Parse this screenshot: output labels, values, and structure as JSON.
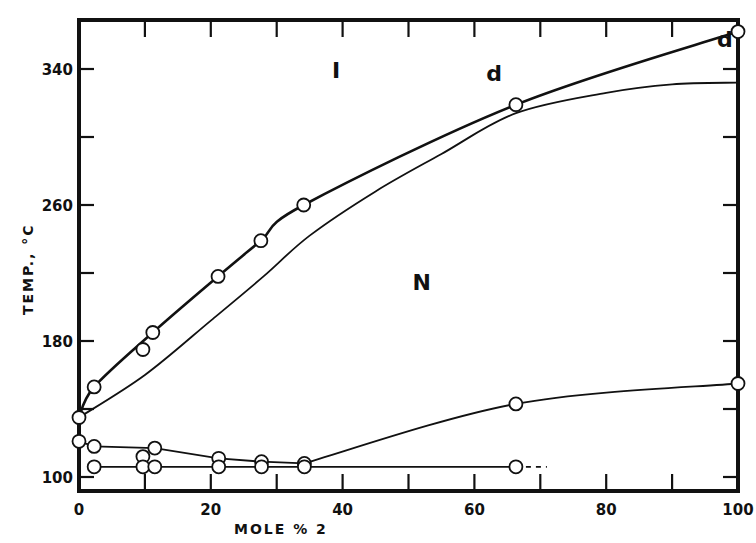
{
  "chart_data": {
    "type": "line",
    "title": "",
    "xlabel": "MOLE % 2",
    "ylabel": "TEMP., °C",
    "xlim": [
      0,
      100
    ],
    "ylim": [
      92,
      369
    ],
    "grid": false,
    "x_ticks": [
      0,
      20,
      40,
      60,
      80,
      100
    ],
    "x_minor_ticks": [
      10,
      30,
      50,
      70,
      90
    ],
    "y_ticks": [
      100,
      180,
      260,
      340
    ],
    "y_minor_ticks": [
      140,
      220,
      300
    ],
    "regions": [
      {
        "label": "I",
        "x": 39,
        "y": 335
      },
      {
        "label": "N",
        "x": 52,
        "y": 210
      }
    ],
    "annotations": [
      {
        "label": "d",
        "x": 63,
        "y": 333
      },
      {
        "label": "d",
        "x": 98,
        "y": 353
      }
    ],
    "series": [
      {
        "name": "clearing (N-I) upper curve",
        "style": "thick",
        "markers": true,
        "points": [
          [
            0,
            135
          ],
          [
            2.3,
            153
          ],
          [
            11.2,
            185
          ],
          [
            21.1,
            218
          ],
          [
            27.6,
            239
          ],
          [
            34.1,
            260
          ],
          [
            66.3,
            319
          ],
          [
            100,
            362
          ]
        ]
      },
      {
        "name": "off-curve point",
        "style": "none",
        "markers": true,
        "points": [
          [
            9.7,
            175
          ]
        ]
      },
      {
        "name": "clearing lower curve",
        "style": "thin",
        "markers": false,
        "points": [
          [
            0,
            135
          ],
          [
            10,
            160
          ],
          [
            20,
            192
          ],
          [
            28,
            218
          ],
          [
            35,
            242
          ],
          [
            45,
            268
          ],
          [
            55,
            290
          ],
          [
            66.3,
            314
          ],
          [
            80,
            326
          ],
          [
            90,
            331
          ],
          [
            100,
            332
          ]
        ]
      },
      {
        "name": "melting (K-N) upper curve",
        "style": "thin",
        "markers": true,
        "points": [
          [
            0,
            121
          ],
          [
            2.3,
            118
          ],
          [
            11.5,
            117
          ],
          [
            21.2,
            111
          ],
          [
            27.7,
            109
          ],
          [
            34.2,
            108
          ],
          [
            66.3,
            143
          ],
          [
            100,
            155
          ]
        ]
      },
      {
        "name": "eutectic / lower line",
        "style": "thin",
        "markers": true,
        "dash_to": 71,
        "points": [
          [
            2.3,
            106
          ],
          [
            9.7,
            112
          ],
          [
            9.7,
            106
          ],
          [
            11.5,
            106
          ],
          [
            21.2,
            106
          ],
          [
            27.7,
            106
          ],
          [
            34.2,
            106
          ],
          [
            66.3,
            106
          ]
        ]
      }
    ]
  }
}
